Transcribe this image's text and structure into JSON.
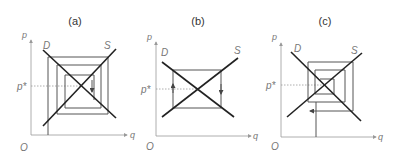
{
  "figure": {
    "panels": [
      {
        "id": "a",
        "title": "(a)",
        "y_axis_label": "p",
        "x_axis_label": "q",
        "origin_label": "O",
        "demand_label": "D",
        "supply_label": "S",
        "equilibrium_price_label": "p*",
        "behavior": "converging cobweb"
      },
      {
        "id": "b",
        "title": "(b)",
        "y_axis_label": "p",
        "x_axis_label": "q",
        "origin_label": "O",
        "demand_label": "D",
        "supply_label": "S",
        "equilibrium_price_label": "p*",
        "behavior": "constant oscillation cobweb"
      },
      {
        "id": "c",
        "title": "(c)",
        "y_axis_label": "p",
        "x_axis_label": "q",
        "origin_label": "O",
        "demand_label": "D",
        "supply_label": "S",
        "equilibrium_price_label": "p*",
        "behavior": "diverging cobweb"
      }
    ]
  },
  "colors": {
    "curve": "#222222",
    "web": "#555555",
    "axis": "#999999",
    "label": "#777777"
  }
}
